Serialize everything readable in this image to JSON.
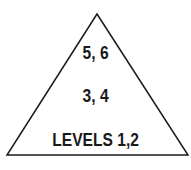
{
  "diagram": {
    "type": "pyramid",
    "levels": [
      {
        "label": "5, 6"
      },
      {
        "label": "3, 4"
      },
      {
        "label": "LEVELS 1,2"
      }
    ],
    "colors": {
      "stroke": "#1a1a1a",
      "fill": "#ffffff",
      "text": "#1a1a1a"
    }
  }
}
